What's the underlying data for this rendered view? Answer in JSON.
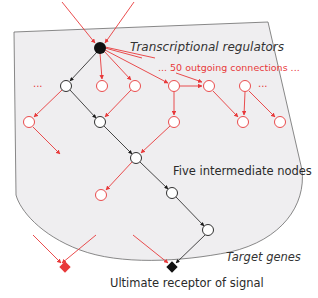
{
  "diagram": {
    "labels": {
      "regulators": "Transcriptional regulators",
      "outgoing": "... 50 outgoing connections ...",
      "intermediate": "Five intermediate nodes",
      "target_genes": "Target genes",
      "receptor": "Ultimate receptor of signal",
      "ellipsis_left": "...",
      "ellipsis_right": "..."
    },
    "colors": {
      "red": "#e8393a",
      "black": "#1a1a1a",
      "panel_fill": "#efeef0",
      "panel_stroke": "#6b6b6b"
    },
    "nodes": [
      {
        "id": "hub",
        "type": "filled-black",
        "x": 100,
        "y": 48
      },
      {
        "id": "n1a",
        "type": "black-outline",
        "x": 66,
        "y": 86
      },
      {
        "id": "n1b",
        "type": "red-outline",
        "x": 102,
        "y": 86
      },
      {
        "id": "n1c",
        "type": "red-outline",
        "x": 135,
        "y": 86
      },
      {
        "id": "n1d",
        "type": "red-outline",
        "x": 174,
        "y": 86
      },
      {
        "id": "n1e",
        "type": "red-outline",
        "x": 209,
        "y": 86
      },
      {
        "id": "n1f",
        "type": "red-outline",
        "x": 245,
        "y": 86
      },
      {
        "id": "n2a",
        "type": "red-outline",
        "x": 29,
        "y": 122
      },
      {
        "id": "n2b",
        "type": "black-outline",
        "x": 100,
        "y": 122
      },
      {
        "id": "n2c",
        "type": "red-outline",
        "x": 174,
        "y": 122
      },
      {
        "id": "n2d",
        "type": "red-outline",
        "x": 243,
        "y": 122
      },
      {
        "id": "n2e",
        "type": "red-outline",
        "x": 280,
        "y": 122
      },
      {
        "id": "n3a",
        "type": "black-outline",
        "x": 136,
        "y": 158
      },
      {
        "id": "n4a",
        "type": "red-outline",
        "x": 101,
        "y": 195
      },
      {
        "id": "n4b",
        "type": "black-outline",
        "x": 172,
        "y": 193
      },
      {
        "id": "n5a",
        "type": "black-outline",
        "x": 208,
        "y": 230
      },
      {
        "id": "target-red",
        "type": "red-diamond",
        "x": 65,
        "y": 267
      },
      {
        "id": "target-black",
        "type": "black-diamond",
        "x": 172,
        "y": 267
      }
    ]
  }
}
